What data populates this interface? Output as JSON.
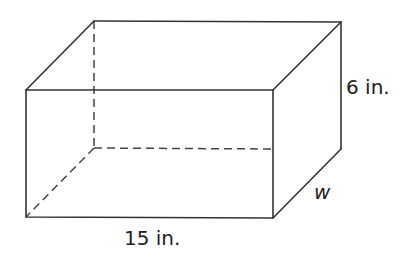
{
  "diagram": {
    "type": "rectangular-prism",
    "labels": {
      "height": "6 in.",
      "length": "15 in.",
      "width": "w"
    },
    "colors": {
      "edge": "#333333",
      "background": "#ffffff"
    },
    "vertices": {
      "front_top_left": [
        26,
        90
      ],
      "front_top_right": [
        273,
        90
      ],
      "front_bottom_left": [
        26,
        217
      ],
      "front_bottom_right": [
        273,
        218
      ],
      "back_top_left": [
        94,
        21
      ],
      "back_top_right": [
        341,
        22
      ],
      "back_bottom_left": [
        94,
        148
      ],
      "back_bottom_right": [
        341,
        149
      ]
    }
  }
}
